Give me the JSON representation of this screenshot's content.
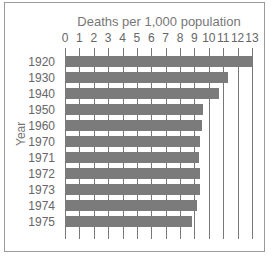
{
  "chart_data": {
    "type": "bar",
    "orientation": "horizontal",
    "title": "Deaths per 1,000 population",
    "xlabel": "Deaths per 1,000 population",
    "ylabel": "Year",
    "xlim": [
      0,
      13
    ],
    "xticks": [
      "0",
      "1",
      "2",
      "3",
      "4",
      "5",
      "6",
      "7",
      "8",
      "9",
      "10",
      "11",
      "12",
      "13"
    ],
    "categories": [
      "1920",
      "1930",
      "1940",
      "1950",
      "1960",
      "1970",
      "1971",
      "1972",
      "1973",
      "1974",
      "1975"
    ],
    "values": [
      13.0,
      11.3,
      10.7,
      9.6,
      9.5,
      9.4,
      9.3,
      9.4,
      9.4,
      9.2,
      8.8
    ],
    "grid": true,
    "bar_color": "#7b7b7b"
  }
}
